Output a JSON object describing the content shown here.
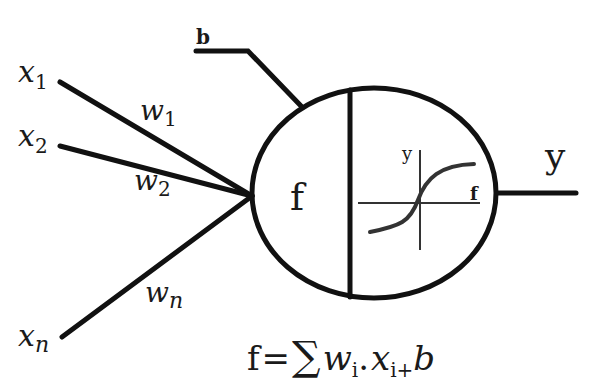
{
  "diagram": {
    "inputs": [
      {
        "label": "x",
        "sub": "1",
        "weight": "w",
        "weight_sub": "1"
      },
      {
        "label": "x",
        "sub": "2",
        "weight": "w",
        "weight_sub": "2"
      },
      {
        "label": "x",
        "sub": "n",
        "weight": "w",
        "weight_sub": "n"
      }
    ],
    "bias": {
      "label": "b"
    },
    "neuron": {
      "sum_label": "f",
      "activation": {
        "y_axis_label": "y",
        "x_axis_label": "f",
        "shape": "sigmoid"
      }
    },
    "output": {
      "label": "y"
    },
    "formula": {
      "lhs": "f",
      "eq": "=",
      "sigma": "∑",
      "w": "w",
      "w_sub": "i",
      "dot": ".",
      "x": "x",
      "x_sub": "i",
      "plus": "+",
      "b": "b"
    },
    "colors": {
      "ink": "#111111",
      "background": "#ffffff"
    }
  }
}
